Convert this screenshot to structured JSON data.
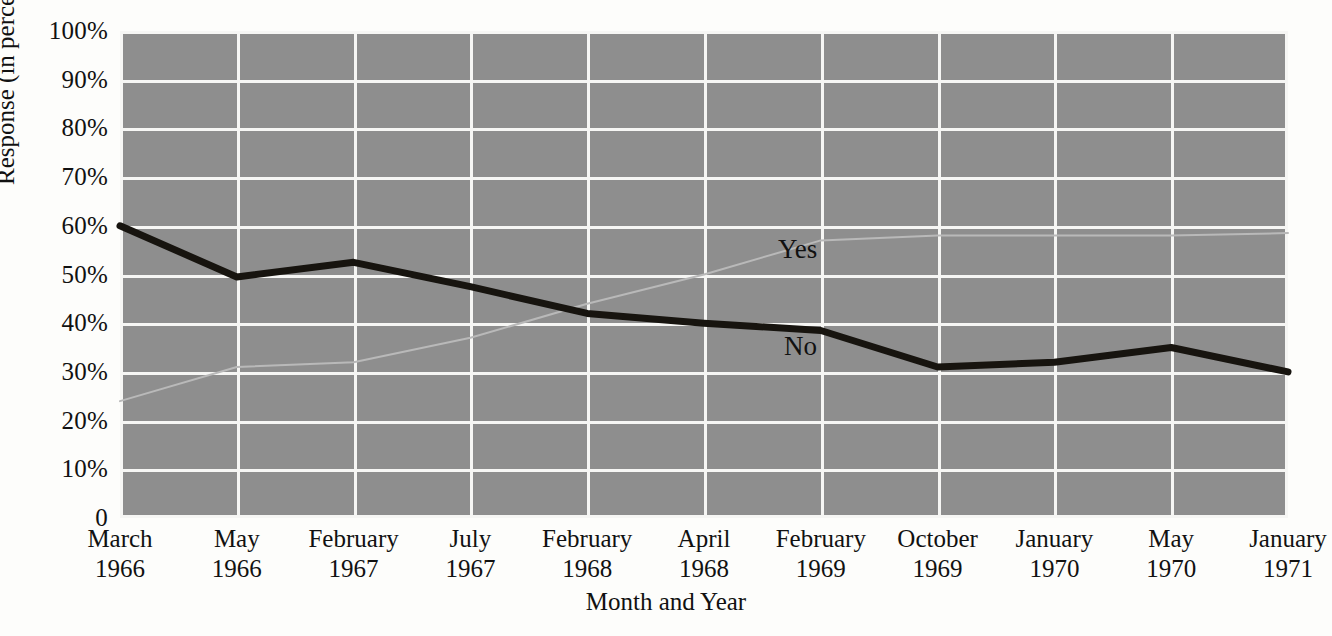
{
  "chart_data": {
    "type": "line",
    "title": "",
    "xlabel": "Month and Year",
    "ylabel": "Response (in percent)",
    "ylim": [
      0,
      100
    ],
    "ytick_labels": [
      "100%",
      "90%",
      "80%",
      "70%",
      "60%",
      "50%",
      "40%",
      "30%",
      "20%",
      "10%",
      "0"
    ],
    "ytick_values": [
      100,
      90,
      80,
      70,
      60,
      50,
      40,
      30,
      20,
      10,
      0
    ],
    "grid": true,
    "legend_position": "inline-annotations",
    "categories": [
      "March 1966",
      "May 1966",
      "February 1967",
      "July 1967",
      "February 1968",
      "April 1968",
      "February 1969",
      "October 1969",
      "January 1970",
      "May 1970",
      "January 1971"
    ],
    "category_months": [
      "March",
      "May",
      "February",
      "July",
      "February",
      "April",
      "February",
      "October",
      "January",
      "May",
      "January"
    ],
    "category_years": [
      "1966",
      "1966",
      "1967",
      "1967",
      "1968",
      "1968",
      "1969",
      "1969",
      "1970",
      "1970",
      "1971"
    ],
    "series": [
      {
        "name": "No",
        "color": "#17140f",
        "width": 7,
        "label_text": "No",
        "values": [
          60,
          49.5,
          52.5,
          47.5,
          42,
          40,
          38.5,
          31,
          32,
          35,
          30
        ]
      },
      {
        "name": "Yes",
        "color": "#b9b9b9",
        "width": 2,
        "label_text": "Yes",
        "values": [
          24,
          31,
          32,
          37,
          44,
          50,
          57,
          58,
          58,
          58,
          58.5
        ]
      }
    ],
    "plot_background_color": "#8e8e8e",
    "gridline_color": "#f6f6f4",
    "page_background_color": "#fdfdfb"
  }
}
